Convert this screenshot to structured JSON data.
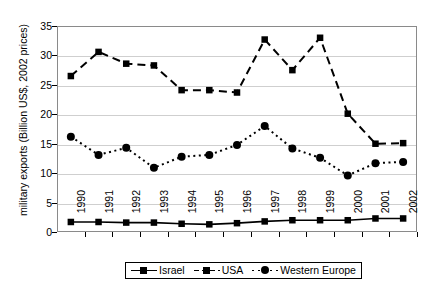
{
  "chart_data": {
    "type": "line",
    "title": "",
    "xlabel": "",
    "ylabel": "military exports (Billion US$, 2002 prices)",
    "categories": [
      "1990",
      "1991",
      "1992",
      "1993",
      "1994",
      "1995",
      "1996",
      "1997",
      "1998",
      "1999",
      "2000",
      "2001",
      "2002"
    ],
    "ylim": [
      0,
      35
    ],
    "yticks": [
      0,
      5,
      10,
      15,
      20,
      25,
      30,
      35
    ],
    "ytick_labels": [
      "0",
      "5",
      "10",
      "15",
      "20",
      "25",
      "30",
      "35"
    ],
    "grid": true,
    "legend_position": "bottom",
    "series": [
      {
        "name": "Israel",
        "marker": "square",
        "line_style": "solid",
        "color": "#000000",
        "values": [
          1.7,
          1.7,
          1.6,
          1.6,
          1.4,
          1.3,
          1.5,
          1.8,
          2.0,
          2.0,
          2.0,
          2.3,
          2.3
        ]
      },
      {
        "name": "USA",
        "marker": "square",
        "line_style": "dashed",
        "color": "#000000",
        "values": [
          26.5,
          30.6,
          28.6,
          28.3,
          24.1,
          24.1,
          23.7,
          32.7,
          27.5,
          33.0,
          20.1,
          15.0,
          15.1
        ]
      },
      {
        "name": "Western Europe",
        "marker": "circle",
        "line_style": "dotted",
        "color": "#000000",
        "values": [
          16.2,
          13.1,
          14.3,
          10.9,
          12.8,
          13.1,
          14.8,
          18.0,
          14.2,
          12.6,
          9.6,
          11.7,
          11.9
        ]
      }
    ]
  },
  "legend": {
    "entries": [
      {
        "label": "Israel"
      },
      {
        "label": "USA"
      },
      {
        "label": "Western Europe"
      }
    ]
  }
}
